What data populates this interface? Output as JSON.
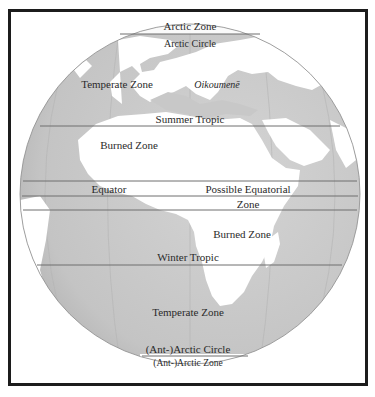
{
  "map": {
    "colors": {
      "ocean": "#c6c6c6",
      "land": "#ffffff",
      "lines": "#6e6e6e",
      "frame": "#1c1c1c",
      "text": "#2a2a2a"
    },
    "labels": {
      "arctic_zone": "Arctic Zone",
      "arctic_circle": "Arctic Circle",
      "temperate_zone_north": "Temperate Zone",
      "oikoumene": "Oikoumenē",
      "summer_tropic": "Summer Tropic",
      "burned_zone_north": "Burned Zone",
      "equator": "Equator",
      "possible_equatorial": "Possible Equatorial",
      "zone": "Zone",
      "burned_zone_south": "Burned Zone",
      "winter_tropic": "Winter Tropic",
      "temperate_zone_south": "Temperate Zone",
      "antarctic_circle": "(Ant-)Arctic Circle",
      "antarctic_zone": "(Ant-)Arctic Zone"
    }
  }
}
